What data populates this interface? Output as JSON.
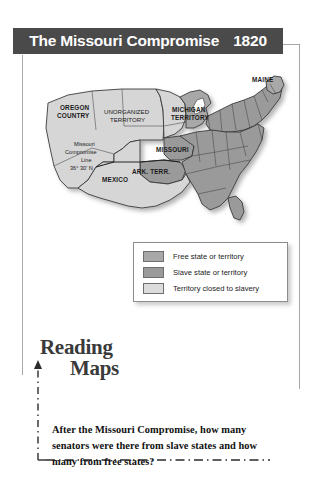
{
  "banner": {
    "title": "The Missouri Compromise",
    "year": "1820",
    "background_color": "#4a4a4a",
    "text_color": "#ffffff"
  },
  "map": {
    "alt": "Map of the United States in 1820 showing free states, slave states, and territory closed to slavery",
    "colors": {
      "free": "#a8a8a8",
      "slave": "#9a9a9a",
      "closed": "#d6d6d6",
      "outline": "#333333"
    },
    "labels": [
      {
        "text": "OREGON",
        "style": "bold"
      },
      {
        "text": "COUNTRY",
        "style": "bold"
      },
      {
        "text": "UNORGANIZED",
        "style": "regular"
      },
      {
        "text": "TERRITORY",
        "style": "regular"
      },
      {
        "text": "MICHIGAN",
        "style": "bold"
      },
      {
        "text": "TERRITORY",
        "style": "bold"
      },
      {
        "text": "MAINE",
        "style": "bold"
      },
      {
        "text": "MISSOURI",
        "style": "bold"
      },
      {
        "text": "ARK. TERR.",
        "style": "bold"
      },
      {
        "text": "MEXICO",
        "style": "bold"
      },
      {
        "text": "Missouri",
        "style": "regular"
      },
      {
        "text": "Compromise",
        "style": "regular"
      },
      {
        "text": "Line",
        "style": "regular"
      },
      {
        "text": "36° 30' N",
        "style": "regular"
      }
    ]
  },
  "legend": {
    "items": [
      {
        "label": "Free state or territory",
        "color": "#a8a8a8"
      },
      {
        "label": "Slave state or territory",
        "color": "#9a9a9a"
      },
      {
        "label": "Territory closed to slavery",
        "color": "#dcdcdc"
      }
    ]
  },
  "reading_maps": {
    "line1": "Reading",
    "line2": "Maps"
  },
  "question": {
    "text": "After the Missouri Compromise, how many senators were there from slave states and how many from free states?"
  }
}
